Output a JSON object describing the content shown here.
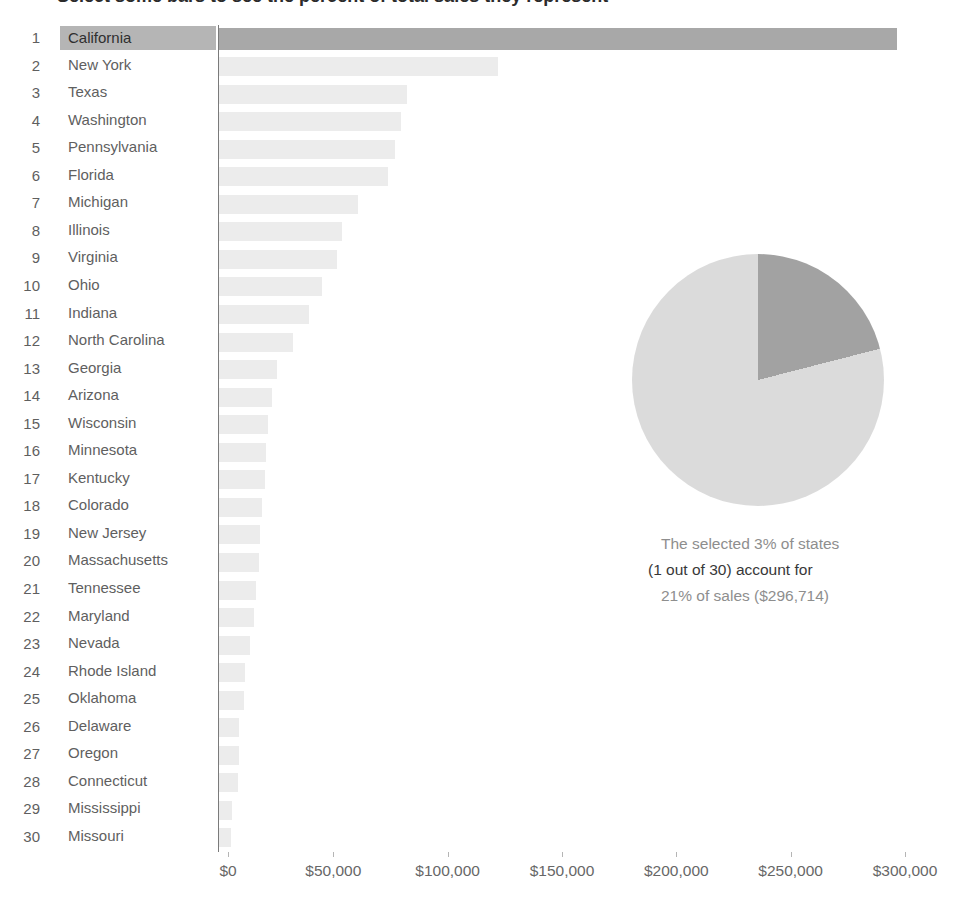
{
  "title": "Select some bars to see the percent of total sales they represent",
  "chart_data": [
    {
      "type": "bar",
      "orientation": "horizontal",
      "title": "Sales by state, ranked",
      "xlabel": "",
      "ylabel": "",
      "xlim": [
        0,
        300000
      ],
      "grid": false,
      "x_axis": {
        "ticks": [
          "$0",
          "$50,000",
          "$100,000",
          "$150,000",
          "$200,000",
          "$250,000",
          "$300,000"
        ]
      },
      "selected_state": "California",
      "rows": [
        {
          "rank": 1,
          "state": "California",
          "sales": 296714,
          "selected": true
        },
        {
          "rank": 2,
          "state": "New York",
          "sales": 122000,
          "selected": false
        },
        {
          "rank": 3,
          "state": "Texas",
          "sales": 82000,
          "selected": false
        },
        {
          "rank": 4,
          "state": "Washington",
          "sales": 79500,
          "selected": false
        },
        {
          "rank": 5,
          "state": "Pennsylvania",
          "sales": 77000,
          "selected": false
        },
        {
          "rank": 6,
          "state": "Florida",
          "sales": 74000,
          "selected": false
        },
        {
          "rank": 7,
          "state": "Michigan",
          "sales": 61000,
          "selected": false
        },
        {
          "rank": 8,
          "state": "Illinois",
          "sales": 54000,
          "selected": false
        },
        {
          "rank": 9,
          "state": "Virginia",
          "sales": 51500,
          "selected": false
        },
        {
          "rank": 10,
          "state": "Ohio",
          "sales": 45000,
          "selected": false
        },
        {
          "rank": 11,
          "state": "Indiana",
          "sales": 39500,
          "selected": false
        },
        {
          "rank": 12,
          "state": "North Carolina",
          "sales": 32500,
          "selected": false
        },
        {
          "rank": 13,
          "state": "Georgia",
          "sales": 25500,
          "selected": false
        },
        {
          "rank": 14,
          "state": "Arizona",
          "sales": 23000,
          "selected": false
        },
        {
          "rank": 15,
          "state": "Wisconsin",
          "sales": 21500,
          "selected": false
        },
        {
          "rank": 16,
          "state": "Minnesota",
          "sales": 20500,
          "selected": false
        },
        {
          "rank": 17,
          "state": "Kentucky",
          "sales": 20000,
          "selected": false
        },
        {
          "rank": 18,
          "state": "Colorado",
          "sales": 19000,
          "selected": false
        },
        {
          "rank": 19,
          "state": "New Jersey",
          "sales": 18000,
          "selected": false
        },
        {
          "rank": 20,
          "state": "Massachusetts",
          "sales": 17500,
          "selected": false
        },
        {
          "rank": 21,
          "state": "Tennessee",
          "sales": 16000,
          "selected": false
        },
        {
          "rank": 22,
          "state": "Maryland",
          "sales": 15500,
          "selected": false
        },
        {
          "rank": 23,
          "state": "Nevada",
          "sales": 13500,
          "selected": false
        },
        {
          "rank": 24,
          "state": "Rhode Island",
          "sales": 11500,
          "selected": false
        },
        {
          "rank": 25,
          "state": "Oklahoma",
          "sales": 11000,
          "selected": false
        },
        {
          "rank": 26,
          "state": "Delaware",
          "sales": 8800,
          "selected": false
        },
        {
          "rank": 27,
          "state": "Oregon",
          "sales": 8600,
          "selected": false
        },
        {
          "rank": 28,
          "state": "Connecticut",
          "sales": 8400,
          "selected": false
        },
        {
          "rank": 29,
          "state": "Mississippi",
          "sales": 5600,
          "selected": false
        },
        {
          "rank": 30,
          "state": "Missouri",
          "sales": 5300,
          "selected": false
        }
      ]
    },
    {
      "type": "pie",
      "title": "Share of total sales",
      "start_angle_deg": 0,
      "direction": "clockwise",
      "legend": "none",
      "slices": [
        {
          "label": "Selected states",
          "pct": 21,
          "color": "#a2a2a2"
        },
        {
          "label": "All other states",
          "pct": 79,
          "color": "#dbdbdb"
        }
      ]
    }
  ],
  "summary": {
    "line1": "The selected 3% of states",
    "line2": "(1 out of 30) account for",
    "line3": "21% of sales ($296,714)"
  },
  "colors": {
    "selected_bar": "#a8a8a8",
    "selected_row_bg": "#b5b5b5",
    "unselected_bar": "#ececec",
    "axis_line": "#7a7a7a",
    "label_text": "#5f5f5f",
    "tick_label_text": "#676767",
    "summary_gray": "#8e8e8e",
    "summary_dark": "#383838"
  }
}
